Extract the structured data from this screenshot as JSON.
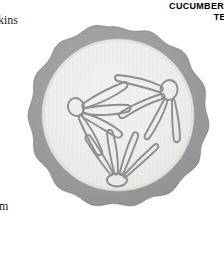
{
  "page": {
    "width": 224,
    "height": 253,
    "background_color": "#ffffff"
  },
  "caption": {
    "line_1": "CUCUMBER",
    "line_2": "TEMP"
  },
  "margin_labels": {
    "top": "kins",
    "bottom": "m"
  },
  "illustration": {
    "name": "cucumber-cross-section",
    "subject": "cucumber",
    "view": "cross-section",
    "style": "grayscale-botanical-line-drawing",
    "colors": {
      "rind": "#9d9d9d",
      "rind_outline": "#8a8a8a",
      "flesh": "#ececea",
      "flesh_inner": "#f3f3f1",
      "seed_outline": "#8e8e8e",
      "background": "#ffffff"
    },
    "rind": {
      "label": "scalloped outer rind",
      "scallop_count": 20,
      "thickness_px": 13
    },
    "flesh": {
      "label": "pale inner flesh"
    },
    "seed_clusters": [
      {
        "name": "left-cluster",
        "center_oval": true,
        "seed_count": 5
      },
      {
        "name": "upper-right-cluster",
        "center_oval": true,
        "seed_count": 5
      },
      {
        "name": "bottom-cluster",
        "center_oval": true,
        "seed_count": 5
      }
    ]
  }
}
